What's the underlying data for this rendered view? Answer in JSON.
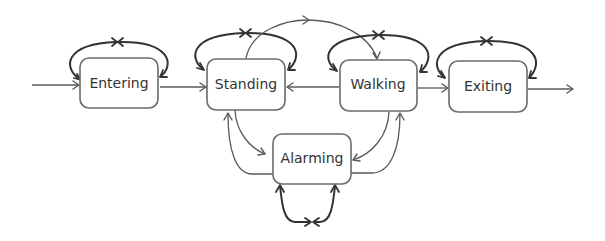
{
  "diagram": {
    "type": "state-transition-diagram",
    "colors": {
      "node_stroke": "#6a6a6a",
      "edge": "#5a5a5a",
      "self_loop": "#333333",
      "text": "#333333",
      "background": "#ffffff"
    },
    "nodes": [
      {
        "id": "entering",
        "label": "Entering"
      },
      {
        "id": "standing",
        "label": "Standing"
      },
      {
        "id": "walking",
        "label": "Walking"
      },
      {
        "id": "exiting",
        "label": "Exiting"
      },
      {
        "id": "alarming",
        "label": "Alarming"
      }
    ],
    "edges": [
      {
        "from": "start",
        "to": "entering"
      },
      {
        "from": "entering",
        "to": "entering",
        "kind": "self-loop"
      },
      {
        "from": "entering",
        "to": "standing"
      },
      {
        "from": "standing",
        "to": "standing",
        "kind": "self-loop"
      },
      {
        "from": "standing",
        "to": "walking"
      },
      {
        "from": "walking",
        "to": "standing"
      },
      {
        "from": "walking",
        "to": "walking",
        "kind": "self-loop"
      },
      {
        "from": "walking",
        "to": "exiting"
      },
      {
        "from": "exiting",
        "to": "exiting",
        "kind": "self-loop"
      },
      {
        "from": "exiting",
        "to": "end"
      },
      {
        "from": "standing",
        "to": "alarming"
      },
      {
        "from": "alarming",
        "to": "standing"
      },
      {
        "from": "walking",
        "to": "alarming"
      },
      {
        "from": "alarming",
        "to": "walking"
      },
      {
        "from": "alarming",
        "to": "alarming",
        "kind": "self-loop"
      }
    ]
  }
}
